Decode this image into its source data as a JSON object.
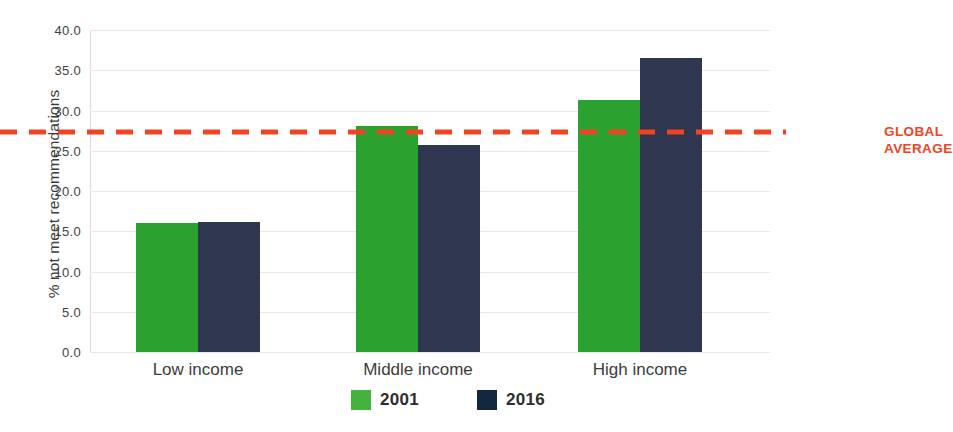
{
  "chart_data": {
    "type": "bar",
    "title": "",
    "subtitle": "",
    "xlabel": "",
    "ylabel": "% not meet recommendations",
    "categories": [
      "Low income",
      "Middle income",
      "High income"
    ],
    "series": [
      {
        "name": "2001",
        "color": "#2ba22f",
        "values": [
          16.0,
          28.1,
          31.3
        ]
      },
      {
        "name": "2016",
        "color": "#2e3650",
        "values": [
          16.1,
          25.7,
          36.5
        ]
      }
    ],
    "ylim": [
      0.0,
      40.0
    ],
    "ytick_step": 5.0,
    "yticks": [
      "40.0",
      "35.0",
      "30.0",
      "25.0",
      "20.0",
      "15.0",
      "10.0",
      "5.0",
      "0.0"
    ],
    "ytick_values": [
      40.0,
      35.0,
      30.0,
      25.0,
      20.0,
      15.0,
      10.0,
      5.0,
      0.0
    ],
    "grid": true,
    "legend_position": "bottom",
    "annotations": [
      {
        "name": "global-average",
        "label": "GLOBAL\nAVERAGE",
        "label_line1": "GLOBAL",
        "label_line2": "AVERAGE",
        "type": "horizontal-reference-line",
        "value": 27.3,
        "style": "dashed",
        "color": "#f04323"
      }
    ]
  },
  "legend": {
    "items": [
      {
        "label": "2001",
        "color": "#44b23c"
      },
      {
        "label": "2016",
        "color": "#12273f"
      }
    ]
  },
  "colors": {
    "series_2001": "#2ba22f",
    "series_2016": "#2e3650",
    "reference_line": "#f04323",
    "grid": "#e8e8e8",
    "text": "#3b3b3b",
    "background": "#ffffff"
  }
}
